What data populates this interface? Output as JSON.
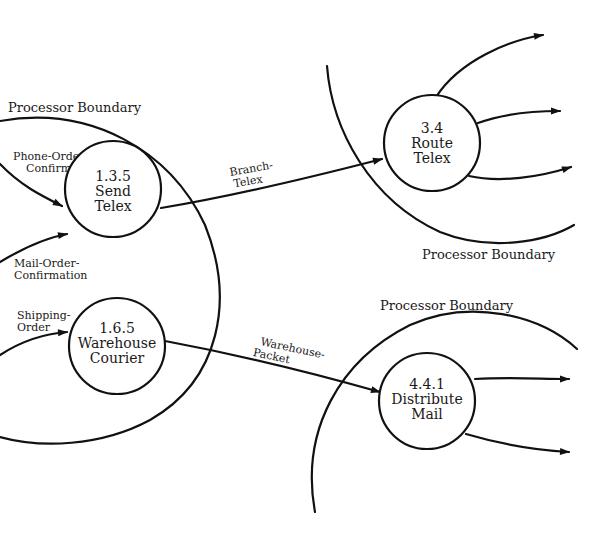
{
  "diagram": {
    "type": "data-flow-diagram",
    "colors": {
      "ink": "#111111",
      "background": "#ffffff"
    },
    "boundaries": [
      {
        "id": "left",
        "label": "Processor Boundary"
      },
      {
        "id": "top-right",
        "label": "Processor Boundary"
      },
      {
        "id": "bottom-right",
        "label": "Processor Boundary"
      }
    ],
    "processes": [
      {
        "id": "send-telex",
        "number": "1.3.5",
        "line1": "Send",
        "line2": "Telex"
      },
      {
        "id": "warehouse-courier",
        "number": "1.6.5",
        "line1": "Warehouse",
        "line2": "Courier"
      },
      {
        "id": "route-telex",
        "number": "3.4",
        "line1": "Route",
        "line2": "Telex"
      },
      {
        "id": "distribute-mail",
        "number": "4.4.1",
        "line1": "Distribute",
        "line2": "Mail"
      }
    ],
    "flows": [
      {
        "id": "phone-order-confirmation",
        "line1": "Phone-Order-",
        "line2": "Confirmation",
        "to": "send-telex"
      },
      {
        "id": "mail-order-confirmation",
        "line1": "Mail-Order-",
        "line2": "Confirmation",
        "to": "send-telex"
      },
      {
        "id": "shipping-order",
        "line1": "Shipping-",
        "line2": "Order",
        "to": "warehouse-courier"
      },
      {
        "id": "branch-telex",
        "line1": "Branch-",
        "line2": "Telex",
        "from": "send-telex",
        "to": "route-telex"
      },
      {
        "id": "warehouse-packet",
        "line1": "Warehouse-",
        "line2": "Packet",
        "from": "warehouse-courier",
        "to": "distribute-mail"
      },
      {
        "id": "route-telex-out-1",
        "from": "route-telex"
      },
      {
        "id": "route-telex-out-2",
        "from": "route-telex"
      },
      {
        "id": "route-telex-out-3",
        "from": "route-telex"
      },
      {
        "id": "distribute-mail-out-1",
        "from": "distribute-mail"
      },
      {
        "id": "distribute-mail-out-2",
        "from": "distribute-mail"
      }
    ]
  }
}
